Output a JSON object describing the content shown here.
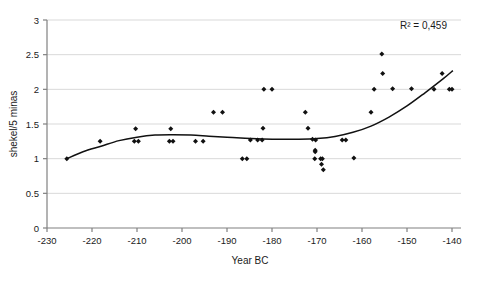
{
  "chart_data": {
    "type": "scatter",
    "title": "",
    "xlabel": "Year BC",
    "ylabel": "shekel/5 minas",
    "xlim": [
      -230,
      -138
    ],
    "ylim": [
      0,
      3
    ],
    "xticks": [
      -230,
      -220,
      -210,
      -200,
      -190,
      -180,
      -170,
      -160,
      -150,
      -140
    ],
    "xtick_labels": [
      "-230",
      "-220",
      "-210",
      "-200",
      "-190",
      "-180",
      "-170",
      "-160",
      "-150",
      "-140"
    ],
    "yticks": [
      0,
      0.5,
      1,
      1.5,
      2,
      2.5,
      3
    ],
    "ytick_labels": [
      "0",
      "0.5",
      "1",
      "1.5",
      "2",
      "2.5",
      "3"
    ],
    "grid": "horizontal",
    "legend": "none",
    "marker": "diamond",
    "marker_color": "#111111",
    "grid_color": "#d9d9d9",
    "axis_color": "#808080",
    "annotations": [
      {
        "text": "R2 = 0,459",
        "display": "R² = 0,459",
        "x": -146,
        "y": 2.82
      }
    ],
    "points": [
      {
        "x": -225.6,
        "y": 1.0
      },
      {
        "x": -218.2,
        "y": 1.25
      },
      {
        "x": -210.3,
        "y": 1.43
      },
      {
        "x": -210.6,
        "y": 1.25
      },
      {
        "x": -209.7,
        "y": 1.25
      },
      {
        "x": -202.5,
        "y": 1.43
      },
      {
        "x": -202.8,
        "y": 1.25
      },
      {
        "x": -202.0,
        "y": 1.25
      },
      {
        "x": -197.0,
        "y": 1.25
      },
      {
        "x": -195.3,
        "y": 1.25
      },
      {
        "x": -193.0,
        "y": 1.67
      },
      {
        "x": -191.0,
        "y": 1.67
      },
      {
        "x": -186.6,
        "y": 1.0
      },
      {
        "x": -185.6,
        "y": 1.0
      },
      {
        "x": -184.8,
        "y": 1.27
      },
      {
        "x": -183.2,
        "y": 1.27
      },
      {
        "x": -182.2,
        "y": 1.27
      },
      {
        "x": -182.0,
        "y": 1.44
      },
      {
        "x": -181.8,
        "y": 2.0
      },
      {
        "x": -180.0,
        "y": 2.0
      },
      {
        "x": -172.6,
        "y": 1.67
      },
      {
        "x": -172.0,
        "y": 1.44
      },
      {
        "x": -171.0,
        "y": 1.28
      },
      {
        "x": -170.3,
        "y": 1.27
      },
      {
        "x": -170.4,
        "y": 1.12
      },
      {
        "x": -170.4,
        "y": 1.1
      },
      {
        "x": -170.5,
        "y": 1.0
      },
      {
        "x": -169.2,
        "y": 1.0
      },
      {
        "x": -168.8,
        "y": 1.0
      },
      {
        "x": -169.0,
        "y": 0.92
      },
      {
        "x": -168.6,
        "y": 0.84
      },
      {
        "x": -164.4,
        "y": 1.27
      },
      {
        "x": -163.6,
        "y": 1.27
      },
      {
        "x": -161.8,
        "y": 1.01
      },
      {
        "x": -158.0,
        "y": 1.67
      },
      {
        "x": -157.3,
        "y": 2.0
      },
      {
        "x": -155.6,
        "y": 2.51
      },
      {
        "x": -155.4,
        "y": 2.23
      },
      {
        "x": -153.2,
        "y": 2.01
      },
      {
        "x": -149.0,
        "y": 2.01
      },
      {
        "x": -144.0,
        "y": 2.0
      },
      {
        "x": -142.2,
        "y": 2.23
      },
      {
        "x": -140.6,
        "y": 2.0
      },
      {
        "x": -140.0,
        "y": 2.0
      }
    ],
    "trendline": {
      "type": "polynomial",
      "r_squared": 0.459,
      "r_squared_label": "0,459",
      "path_points": [
        {
          "x": -225.6,
          "y": 1.0
        },
        {
          "x": -222.0,
          "y": 1.1
        },
        {
          "x": -218.0,
          "y": 1.18
        },
        {
          "x": -214.0,
          "y": 1.26
        },
        {
          "x": -210.0,
          "y": 1.31
        },
        {
          "x": -206.0,
          "y": 1.34
        },
        {
          "x": -202.0,
          "y": 1.345
        },
        {
          "x": -198.0,
          "y": 1.34
        },
        {
          "x": -194.0,
          "y": 1.325
        },
        {
          "x": -190.0,
          "y": 1.31
        },
        {
          "x": -186.0,
          "y": 1.295
        },
        {
          "x": -182.0,
          "y": 1.285
        },
        {
          "x": -178.0,
          "y": 1.28
        },
        {
          "x": -174.0,
          "y": 1.28
        },
        {
          "x": -170.0,
          "y": 1.29
        },
        {
          "x": -166.0,
          "y": 1.32
        },
        {
          "x": -162.0,
          "y": 1.38
        },
        {
          "x": -158.0,
          "y": 1.47
        },
        {
          "x": -154.0,
          "y": 1.6
        },
        {
          "x": -150.0,
          "y": 1.76
        },
        {
          "x": -146.0,
          "y": 1.95
        },
        {
          "x": -142.0,
          "y": 2.15
        },
        {
          "x": -139.8,
          "y": 2.27
        }
      ]
    }
  }
}
